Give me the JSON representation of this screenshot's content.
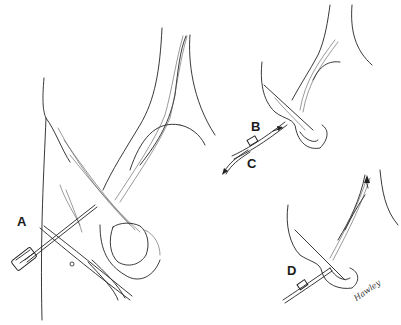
{
  "figure": {
    "panels": [
      {
        "id": "A",
        "label": "A",
        "caption_role": "needle/introducer with clamp inserted into vessel"
      },
      {
        "id": "B",
        "label": "B",
        "caption_role": "catheter advanced over guidewire"
      },
      {
        "id": "C",
        "label": "C",
        "caption_role": "wire withdrawn"
      },
      {
        "id": "D",
        "label": "D",
        "caption_role": "catheter advanced into vessel"
      }
    ],
    "signature": "Hawley",
    "colors": {
      "line": "#222222",
      "background": "#ffffff"
    }
  }
}
